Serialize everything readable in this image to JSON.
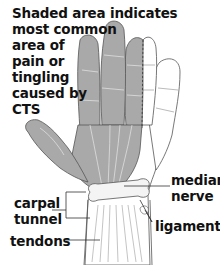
{
  "title": {
    "lines": [
      "Shaded area indicates",
      "most common",
      "area of",
      "pain or",
      "tingling",
      "caused by",
      "CTS"
    ]
  },
  "labels": {
    "median_nerve": [
      "median",
      "nerve"
    ],
    "carpal_tunnel": [
      "carpal",
      "tunnel"
    ],
    "ligaments": "ligaments",
    "tendons": "tendons"
  },
  "colors": {
    "shaded": "#a9a9a9",
    "outline": "#555555",
    "unshaded": "#ffffff",
    "text": "#111111"
  },
  "regions": {
    "shaded": [
      "thumb",
      "index finger",
      "middle finger",
      "half of ring finger",
      "palm (radial side)"
    ],
    "unshaded": [
      "pinky finger",
      "outer half of ring finger",
      "palm (ulnar side)"
    ]
  }
}
